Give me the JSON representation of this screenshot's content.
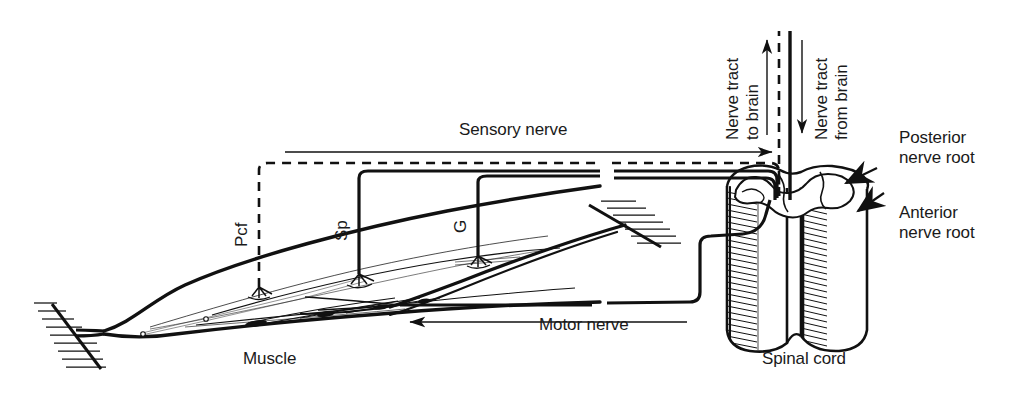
{
  "figure": {
    "type": "anatomical-line-diagram",
    "background_color": "#ffffff",
    "ink_color": "#111111"
  },
  "labels": {
    "sensory_nerve": "Sensory nerve",
    "motor_nerve": "Motor nerve",
    "muscle": "Muscle",
    "spinal_cord": "Spinal cord",
    "nerve_tract_to_brain": "Nerve tract\nto brain",
    "nerve_tract_from_brain": "Nerve tract\nfrom brain",
    "posterior_nerve_root": "Posterior\nnerve root",
    "anterior_nerve_root": "Anterior\nnerve root",
    "receptor_pcf": "Pcf",
    "receptor_sp": "Sp",
    "receptor_g": "G"
  },
  "receptors": [
    {
      "abbr": "Pcf",
      "name": "pacinian-corpuscle-receptor",
      "line_style": "dashed"
    },
    {
      "abbr": "Sp",
      "name": "muscle-spindle-receptor",
      "line_style": "solid"
    },
    {
      "abbr": "G",
      "name": "golgi-tendon-organ-receptor",
      "line_style": "solid"
    }
  ],
  "pathways": [
    {
      "name": "sensory-afferent-pathway",
      "direction": "to-spinal-cord",
      "arrow": "right"
    },
    {
      "name": "motor-efferent-pathway",
      "direction": "from-spinal-cord",
      "arrow": "left"
    },
    {
      "name": "ascending-tract",
      "direction": "to-brain",
      "arrow": "up"
    },
    {
      "name": "descending-tract",
      "direction": "from-brain",
      "arrow": "down"
    }
  ],
  "structures": [
    {
      "name": "skeletal-muscle-belly"
    },
    {
      "name": "bone-attachment-origin"
    },
    {
      "name": "tendon-attachment-insertion"
    },
    {
      "name": "spinal-cord-cylinder"
    },
    {
      "name": "grey-matter-butterfly"
    },
    {
      "name": "posterior-root-arrowhead"
    },
    {
      "name": "anterior-root-arrowhead"
    }
  ]
}
